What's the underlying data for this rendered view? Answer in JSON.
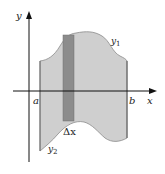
{
  "diagram": {
    "axes": {
      "x_label": "x",
      "y_label": "y"
    },
    "bounds": {
      "left_label": "a",
      "right_label": "b"
    },
    "curves": {
      "upper": {
        "name": "y",
        "subscript": "1"
      },
      "lower": {
        "name": "y",
        "subscript": "2"
      }
    },
    "strip": {
      "label": "Δx"
    },
    "colors": {
      "region_fill": "#cfcfcf",
      "region_stroke": "#8a8a8a",
      "strip_fill": "#8c8c8c",
      "axis": "#111111"
    }
  }
}
